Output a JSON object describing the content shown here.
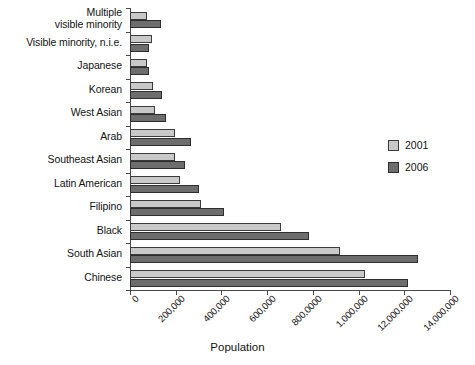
{
  "chart_data": {
    "type": "bar",
    "orientation": "horizontal",
    "title": "",
    "xlabel": "Population",
    "ylabel": "",
    "xlim": [
      0,
      1400000
    ],
    "grid": false,
    "legend_position": "right",
    "categories": [
      "Multiple\nvisible minority",
      "Visible minority, n.i.e.",
      "Japanese",
      "Korean",
      "West Asian",
      "Arab",
      "Southeast Asian",
      "Latin American",
      "Filipino",
      "Black",
      "South Asian",
      "Chinese"
    ],
    "series": [
      {
        "name": "2001",
        "color": "#c9c9c9",
        "values": [
          74000,
          98000,
          73000,
          101000,
          110000,
          195000,
          199000,
          217000,
          309000,
          662000,
          917000,
          1029000
        ]
      },
      {
        "name": "2006",
        "color": "#6d6d6d",
        "values": [
          134000,
          82000,
          81000,
          140000,
          158000,
          265000,
          239000,
          304000,
          410000,
          783000,
          1262000,
          1216000
        ]
      }
    ],
    "xticks": [
      0,
      200000,
      400000,
      600000,
      800000,
      1000000,
      1200000,
      1400000
    ],
    "xticklabels": [
      "0",
      "200,000",
      "400,000",
      "600,000",
      "800,0000",
      "1,000,000",
      "12,000,000",
      "14,000,000"
    ]
  },
  "legend": {
    "items": [
      {
        "label": "2001",
        "key": "y2001"
      },
      {
        "label": "2006",
        "key": "y2006"
      }
    ]
  }
}
